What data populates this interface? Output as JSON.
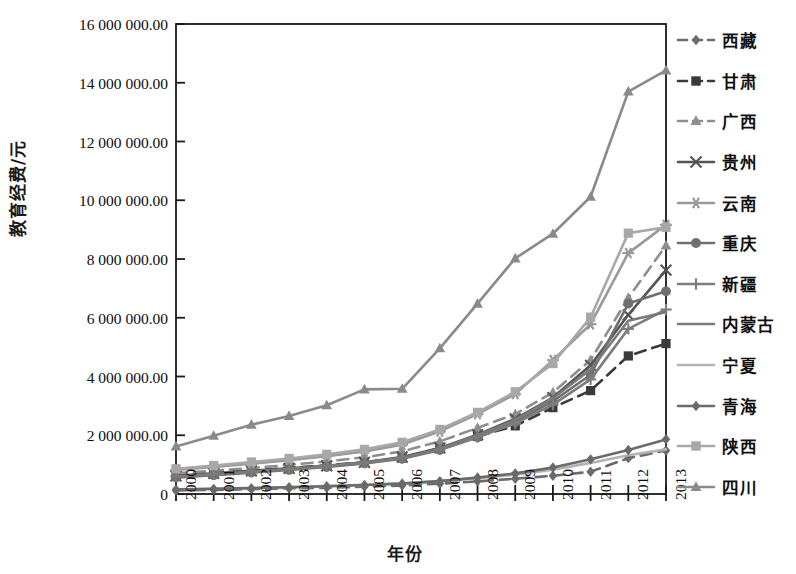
{
  "chart_data": {
    "type": "line",
    "title": "",
    "xlabel": "年份",
    "ylabel": "教育经费/元",
    "x": [
      2000,
      2001,
      2002,
      2003,
      2004,
      2005,
      2006,
      2007,
      2008,
      2009,
      2010,
      2011,
      2012,
      2013
    ],
    "xtick_labels": [
      "2000",
      "2001",
      "2002",
      "2003",
      "2004",
      "2005",
      "2006",
      "2007",
      "2008",
      "2009",
      "2010",
      "2011",
      "2012",
      "2013"
    ],
    "ytick_labels": [
      "16 000 000.00",
      "14 000 000.00",
      "12 000 000.00",
      "10 000 000.00",
      "8 000 000.00",
      "6 000 000.00",
      "4 000 000.00",
      "2 000 000.00",
      "0"
    ],
    "ytick_values": [
      16000000,
      14000000,
      12000000,
      10000000,
      8000000,
      6000000,
      4000000,
      2000000,
      0
    ],
    "ylim": [
      0,
      16000000
    ],
    "xlim": [
      2000,
      2013
    ],
    "grid": false,
    "legend_position": "right",
    "series": [
      {
        "name": "西藏",
        "marker": "diamond",
        "dash": "dashed",
        "color": "#6b6b6b",
        "values": [
          120000,
          140000,
          165000,
          190000,
          215000,
          250000,
          290000,
          350000,
          430000,
          520000,
          620000,
          760000,
          1220000,
          1480000
        ]
      },
      {
        "name": "甘肃",
        "marker": "square",
        "dash": "dashed",
        "color": "#3a3a3a",
        "values": [
          640000,
          720000,
          800000,
          880000,
          980000,
          1080000,
          1230000,
          1560000,
          1960000,
          2320000,
          2940000,
          3520000,
          4700000,
          5120000
        ]
      },
      {
        "name": "广西",
        "marker": "triangle",
        "dash": "dashed",
        "color": "#8e8e8e",
        "values": [
          700000,
          790000,
          880000,
          990000,
          1110000,
          1250000,
          1450000,
          1790000,
          2250000,
          2720000,
          3460000,
          4560000,
          6680000,
          8460000
        ]
      },
      {
        "name": "贵州",
        "marker": "x",
        "dash": "solid",
        "color": "#555555",
        "values": [
          620000,
          700000,
          790000,
          870000,
          960000,
          1080000,
          1260000,
          1570000,
          2020000,
          2560000,
          3280000,
          4380000,
          6100000,
          7620000
        ]
      },
      {
        "name": "云南",
        "marker": "asterisk",
        "dash": "solid",
        "color": "#9a9a9a",
        "values": [
          820000,
          920000,
          1030000,
          1150000,
          1290000,
          1450000,
          1680000,
          2130000,
          2720000,
          3400000,
          4560000,
          5780000,
          8200000,
          9160000
        ]
      },
      {
        "name": "重庆",
        "marker": "circle",
        "dash": "solid",
        "color": "#6f6f6f",
        "values": [
          560000,
          640000,
          730000,
          820000,
          920000,
          1040000,
          1200000,
          1500000,
          1930000,
          2450000,
          3160000,
          4060000,
          6480000,
          6900000
        ]
      },
      {
        "name": "新疆",
        "marker": "plus",
        "dash": "solid",
        "color": "#7d7d7d",
        "values": [
          600000,
          680000,
          760000,
          850000,
          950000,
          1070000,
          1230000,
          1520000,
          1940000,
          2400000,
          3040000,
          3900000,
          5620000,
          6280000
        ]
      },
      {
        "name": "内蒙古",
        "marker": "none",
        "dash": "solid",
        "color": "#7a7a7a",
        "values": [
          580000,
          660000,
          750000,
          840000,
          940000,
          1060000,
          1220000,
          1540000,
          2000000,
          2520000,
          3260000,
          4240000,
          5900000,
          6200000
        ]
      },
      {
        "name": "宁夏",
        "marker": "none",
        "dash": "solid",
        "color": "#b3b3b3",
        "values": [
          160000,
          180000,
          205000,
          235000,
          270000,
          310000,
          360000,
          440000,
          540000,
          660000,
          830000,
          1060000,
          1320000,
          1520000
        ]
      },
      {
        "name": "青海",
        "marker": "diamond-solid",
        "dash": "solid",
        "color": "#6a6a6a",
        "values": [
          150000,
          175000,
          200000,
          230000,
          265000,
          305000,
          355000,
          440000,
          560000,
          700000,
          900000,
          1180000,
          1500000,
          1860000
        ]
      },
      {
        "name": "陕西",
        "marker": "square-light",
        "dash": "solid",
        "color": "#a8a8a8",
        "values": [
          860000,
          970000,
          1090000,
          1210000,
          1350000,
          1520000,
          1760000,
          2200000,
          2780000,
          3480000,
          4440000,
          6020000,
          8880000,
          9080000
        ]
      },
      {
        "name": "四川",
        "marker": "triangle-solid",
        "dash": "solid",
        "color": "#8a8a8a",
        "values": [
          1620000,
          1980000,
          2360000,
          2660000,
          3020000,
          3560000,
          3580000,
          4960000,
          6480000,
          8020000,
          8860000,
          10120000,
          13700000,
          14420000
        ]
      }
    ]
  },
  "legend": {
    "items": [
      {
        "label": "西藏"
      },
      {
        "label": "甘肃"
      },
      {
        "label": "广西"
      },
      {
        "label": "贵州"
      },
      {
        "label": "云南"
      },
      {
        "label": "重庆"
      },
      {
        "label": "新疆"
      },
      {
        "label": "内蒙古"
      },
      {
        "label": "宁夏"
      },
      {
        "label": "青海"
      },
      {
        "label": "陕西"
      },
      {
        "label": "四川"
      }
    ]
  },
  "axis": {
    "frame_color": "#1a1a1a"
  }
}
